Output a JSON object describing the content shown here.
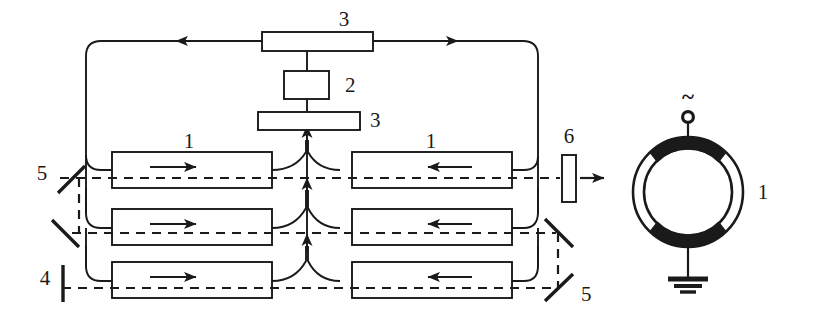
{
  "figure": {
    "background_color": "#ffffff",
    "line_color": "#1a1a1a",
    "electrode_color": "#1a1a1a"
  },
  "labels": {
    "top_beamsplitter": "3",
    "center_module": "2",
    "lower_beamsplitter": "3",
    "amplifier_left_row1": "1",
    "amplifier_right_row1": "1",
    "mirror_left_upper": "5",
    "mirror_left_lower": "4",
    "mirror_right_lower": "5",
    "output_element": "6",
    "tube_label": "1",
    "ac_source": "~"
  },
  "components": [
    {
      "id": "1",
      "name": "amplifier-tube",
      "count": 6,
      "description": "rectangular active elements arranged in three rows, two per row"
    },
    {
      "id": "2",
      "name": "central-module",
      "count": 1,
      "description": "small rectangular block in the upper center"
    },
    {
      "id": "3",
      "name": "beam-splitter-plate",
      "count": 2,
      "description": "wide horizontal plates above and below the central module"
    },
    {
      "id": "4",
      "name": "end-mirror",
      "count": 1,
      "description": "vertical bar at lower left"
    },
    {
      "id": "5",
      "name": "turning-mirror",
      "count": 3,
      "description": "tilted mirror strips at left and lower right"
    },
    {
      "id": "6",
      "name": "output-window",
      "count": 1,
      "description": "small vertical rectangle at the right of the output beam"
    }
  ],
  "rows": [
    {
      "index": 1,
      "left_arrow": "right",
      "right_arrow": "left",
      "label_left": "1",
      "label_right": "1"
    },
    {
      "index": 2,
      "left_arrow": "right",
      "right_arrow": "left"
    },
    {
      "index": 3,
      "left_arrow": "right",
      "right_arrow": "left"
    }
  ],
  "beam_paths": {
    "solid_loop": "closed gas-circulation loop around the amplifier array",
    "dashed_beam": "optical beam path, dashed horizontal lines through each row",
    "output_direction": "right"
  },
  "tube_cross_section": {
    "label": "1",
    "source_symbol": "~",
    "terminal": "small circle electrode tap",
    "ground": "earth ground symbol",
    "electrodes": [
      "top arc electrode",
      "bottom arc electrode"
    ],
    "walls": [
      "outer circle",
      "inner circle"
    ]
  }
}
